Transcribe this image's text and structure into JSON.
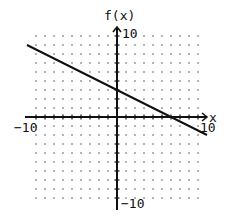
{
  "chart_data": {
    "type": "line",
    "title": "",
    "xlabel": "x",
    "ylabel": "f(x)",
    "xlim": [
      -10,
      10
    ],
    "ylim": [
      -10,
      10
    ],
    "grid": "dots at integer lattice points",
    "tick_labels": {
      "x_min": "-10",
      "x_max": "10",
      "y_min": "-10",
      "y_max": "10"
    },
    "series": [
      {
        "name": "f(x)",
        "equation": "f(x) = -0.5x + 3",
        "x": [
          -10,
          0,
          6,
          10
        ],
        "y": [
          8,
          3,
          0,
          -2
        ]
      }
    ],
    "annotations": {
      "y_intercept": [
        0,
        3
      ],
      "x_intercept": [
        6,
        0
      ]
    }
  },
  "labels": {
    "y_axis": "f(x)",
    "x_axis": "x",
    "y_top": "10",
    "y_bottom": "−10",
    "x_left": "−10",
    "x_right": "10"
  },
  "colors": {
    "line": "#111111",
    "axis": "#111111",
    "grid_dot": "#555555",
    "background": "#ffffff"
  }
}
